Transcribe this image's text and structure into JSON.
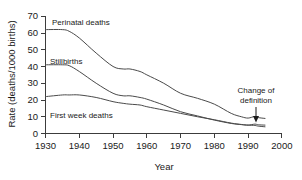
{
  "chart_data": {
    "type": "line",
    "title": "",
    "xlabel": "Year",
    "ylabel": "Rate (deaths/1000 births)",
    "xlim": [
      1930,
      2000
    ],
    "ylim": [
      0,
      70
    ],
    "xticks": [
      "1930",
      "1940",
      "1950",
      "1960",
      "1970",
      "1980",
      "1990",
      "2000"
    ],
    "yticks": [
      "0",
      "10",
      "20",
      "30",
      "40",
      "50",
      "60",
      "70"
    ],
    "grid": false,
    "legend_position": "inline-labels",
    "x": [
      1930,
      1935,
      1937,
      1940,
      1945,
      1950,
      1953,
      1955,
      1958,
      1960,
      1965,
      1970,
      1975,
      1980,
      1985,
      1988,
      1990,
      1992,
      1993,
      1995
    ],
    "series": [
      {
        "name": "Perinatal deaths",
        "label": "Perinatal deaths",
        "values": [
          62,
          62,
          61,
          57,
          48,
          40,
          38.5,
          38.5,
          37,
          35,
          30,
          24,
          21,
          17.5,
          12,
          10,
          9.2,
          10.2,
          9.5,
          9
        ]
      },
      {
        "name": "Stillbirths",
        "label": "Stillbirths",
        "values": [
          41,
          41,
          40.5,
          37,
          30,
          24,
          22.5,
          22.5,
          21.5,
          20.5,
          17,
          13,
          10.5,
          8,
          6,
          5.3,
          5,
          5.6,
          5.2,
          5
        ]
      },
      {
        "name": "First week deaths",
        "label": "First week deaths",
        "values": [
          22,
          23,
          23,
          23,
          21.5,
          19,
          18,
          17.5,
          17,
          16,
          14,
          12,
          10,
          8.2,
          6.2,
          5.4,
          5,
          4.8,
          4.4,
          4
        ]
      }
    ],
    "annotations": [
      {
        "name": "change-of-definition",
        "text_line1": "Change of",
        "text_line2": "definition",
        "points_to_year": 1992,
        "points_to_value": 10.2
      }
    ]
  }
}
